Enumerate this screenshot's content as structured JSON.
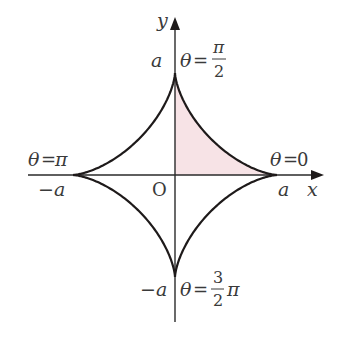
{
  "diagram": {
    "type": "astroid",
    "axes": {
      "x_label": "x",
      "y_label": "y",
      "origin_label": "O"
    },
    "tick_labels": {
      "pos_x": "a",
      "neg_x": "−a",
      "pos_y": "a",
      "neg_y": "−a"
    },
    "parameter_labels": {
      "theta_0": {
        "theta": "θ",
        "eq": "=",
        "value": "0"
      },
      "theta_half_pi": {
        "theta": "θ",
        "eq": "=",
        "num": "π",
        "den": "2"
      },
      "theta_pi": {
        "theta": "θ",
        "eq": "=",
        "value": "π"
      },
      "theta_three_half_pi": {
        "theta": "θ",
        "eq": "=",
        "num": "3",
        "den": "2",
        "suffix": "π"
      }
    },
    "colors": {
      "curve": "#1e1a1a",
      "axis": "#2a2a2a",
      "shade": "#f7e3e6",
      "text": "#3a3a3a"
    }
  }
}
